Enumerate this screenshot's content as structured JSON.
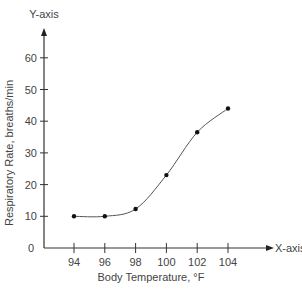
{
  "chart_data": {
    "type": "line",
    "title": "",
    "xlabel": "Body Temperature, °F",
    "ylabel": "Respiratory Rate, breaths/min",
    "x_axis_name": "X-axis",
    "y_axis_name": "Y-axis",
    "x": [
      94,
      96,
      98,
      100,
      102,
      104
    ],
    "series": [
      {
        "name": "Respiratory Rate",
        "values": [
          10,
          10,
          12.3,
          23,
          36.5,
          44
        ]
      }
    ],
    "x_ticks": [
      94,
      96,
      98,
      100,
      102,
      104
    ],
    "y_ticks": [
      0,
      10,
      20,
      30,
      40,
      50,
      60
    ],
    "xlim": [
      92,
      110
    ],
    "ylim": [
      0,
      70
    ],
    "grid": false,
    "legend": "none",
    "smooth": true,
    "colors": {
      "axis": "#333333",
      "line": "#555555",
      "marker": "#111111",
      "text": "#444444"
    }
  }
}
